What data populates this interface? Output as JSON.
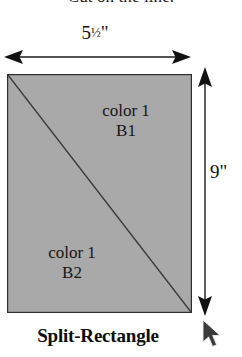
{
  "page": {
    "background_color": "#ffffff",
    "width": 242,
    "height": 357
  },
  "instruction": {
    "text": "Cut on the line."
  },
  "dimensions": {
    "width_label_number": "5",
    "width_label_fraction": "1/2",
    "width_label_unit": "\"",
    "width_label_full": "5 1/2\"",
    "height_label": "9\"",
    "width_arrow_name": "horizontal-double-arrow",
    "height_arrow_name": "vertical-double-arrow"
  },
  "shape": {
    "title": "Split-Rectangle",
    "fill_color": "#a9a9a9",
    "outline_color": "#2e2e2e",
    "diagonal_color": "#3a3a3a",
    "pieces": [
      {
        "id": "B1",
        "color_label": "color 1",
        "piece_label": "B1"
      },
      {
        "id": "B2",
        "color_label": "color 1",
        "piece_label": "B2"
      }
    ]
  },
  "cursor": {
    "name": "mouse-pointer",
    "x": 202,
    "y": 319
  }
}
